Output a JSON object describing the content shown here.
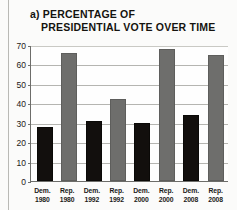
{
  "figure": {
    "title_line1": "a) PERCENTAGE OF",
    "title_line2": "PRESIDENTIAL VOTE OVER TIME"
  },
  "chart_data": {
    "type": "bar",
    "title": "a) PERCENTAGE OF PRESIDENTIAL VOTE OVER TIME",
    "xlabel": "",
    "ylabel": "",
    "ylim": [
      0,
      70
    ],
    "yticks": [
      0,
      10,
      20,
      30,
      40,
      50,
      60,
      70
    ],
    "ytick_labels": [
      "0",
      "10",
      "20",
      "30",
      "40",
      "50",
      "60",
      "70"
    ],
    "grid": true,
    "legend": false,
    "categories": [
      "Dem. 1980",
      "Rep. 1980",
      "Dem. 1992",
      "Rep. 1992",
      "Dem. 2000",
      "Rep. 2000",
      "Dem. 2008",
      "Rep. 2008"
    ],
    "bars": [
      {
        "party": "Dem.",
        "year": "1980",
        "value": 28,
        "color": "#120f0d"
      },
      {
        "party": "Rep.",
        "year": "1980",
        "value": 66,
        "color": "#6e6e6c"
      },
      {
        "party": "Dem.",
        "year": "1992",
        "value": 31,
        "color": "#120f0d"
      },
      {
        "party": "Rep.",
        "year": "1992",
        "value": 42,
        "color": "#6e6e6c"
      },
      {
        "party": "Dem.",
        "year": "2000",
        "value": 30,
        "color": "#120f0d"
      },
      {
        "party": "Rep.",
        "year": "2000",
        "value": 68,
        "color": "#6e6e6c"
      },
      {
        "party": "Dem.",
        "year": "2008",
        "value": 34,
        "color": "#120f0d"
      },
      {
        "party": "Rep.",
        "year": "2008",
        "value": 65,
        "color": "#6e6e6c"
      }
    ],
    "values": [
      28,
      66,
      31,
      42,
      30,
      68,
      34,
      65
    ],
    "colors": {
      "democrat": "#120f0d",
      "republican": "#6e6e6c"
    }
  }
}
